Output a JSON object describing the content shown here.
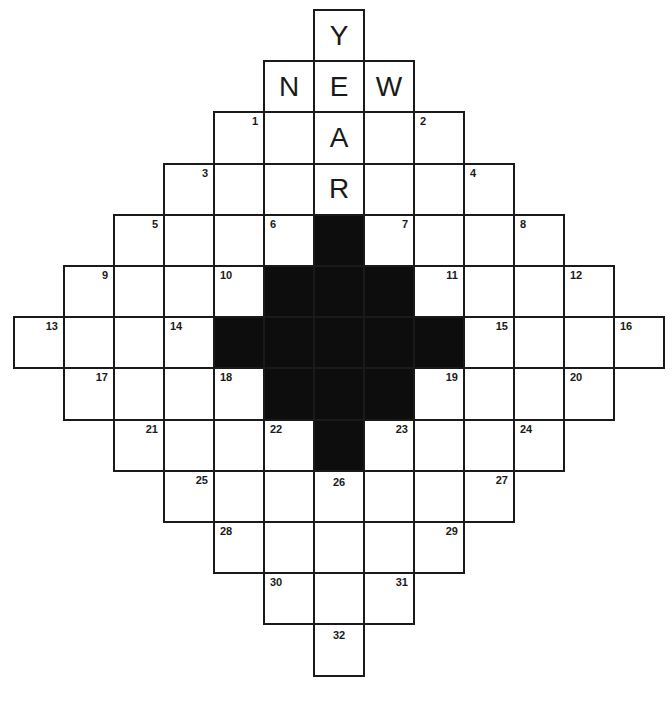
{
  "puzzle": {
    "title": "NEW YEAR crossword",
    "grid": {
      "cols": 13,
      "rows": 13,
      "origin_x": 14,
      "origin_y": 10,
      "cell_w": 50,
      "cell_h": 51.2,
      "colors": {
        "line": "#1a1a1a",
        "black": "#0d0d0d",
        "white": "#ffffff"
      }
    },
    "rows": [
      {
        "cells": [
          {
            "c": 6,
            "letter": "Y"
          }
        ]
      },
      {
        "cells": [
          {
            "c": 5,
            "letter": "N"
          },
          {
            "c": 6,
            "letter": "E"
          },
          {
            "c": 7,
            "letter": "W"
          }
        ]
      },
      {
        "cells": [
          {
            "c": 4,
            "num": "1",
            "pos": "tr"
          },
          {
            "c": 5
          },
          {
            "c": 6,
            "letter": "A"
          },
          {
            "c": 7
          },
          {
            "c": 8,
            "num": "2",
            "pos": "tl"
          }
        ]
      },
      {
        "cells": [
          {
            "c": 3,
            "num": "3",
            "pos": "tr"
          },
          {
            "c": 4
          },
          {
            "c": 5
          },
          {
            "c": 6,
            "letter": "R"
          },
          {
            "c": 7
          },
          {
            "c": 8
          },
          {
            "c": 9,
            "num": "4",
            "pos": "tl"
          }
        ]
      },
      {
        "cells": [
          {
            "c": 2,
            "num": "5",
            "pos": "tr"
          },
          {
            "c": 3
          },
          {
            "c": 4
          },
          {
            "c": 5,
            "num": "6",
            "pos": "tl"
          },
          {
            "c": 6,
            "black": true
          },
          {
            "c": 7,
            "num": "7",
            "pos": "tr"
          },
          {
            "c": 8
          },
          {
            "c": 9
          },
          {
            "c": 10,
            "num": "8",
            "pos": "tl"
          }
        ]
      },
      {
        "cells": [
          {
            "c": 1,
            "num": "9",
            "pos": "tr"
          },
          {
            "c": 2
          },
          {
            "c": 3
          },
          {
            "c": 4,
            "num": "10",
            "pos": "tl"
          },
          {
            "c": 5,
            "black": true
          },
          {
            "c": 6,
            "black": true
          },
          {
            "c": 7,
            "black": true
          },
          {
            "c": 8,
            "num": "11",
            "pos": "tr"
          },
          {
            "c": 9
          },
          {
            "c": 10
          },
          {
            "c": 11,
            "num": "12",
            "pos": "tl"
          }
        ]
      },
      {
        "cells": [
          {
            "c": 0,
            "num": "13",
            "pos": "tr"
          },
          {
            "c": 1
          },
          {
            "c": 2
          },
          {
            "c": 3,
            "num": "14",
            "pos": "tl"
          },
          {
            "c": 4,
            "black": true
          },
          {
            "c": 5,
            "black": true
          },
          {
            "c": 6,
            "black": true
          },
          {
            "c": 7,
            "black": true
          },
          {
            "c": 8,
            "black": true
          },
          {
            "c": 9,
            "num": "15",
            "pos": "tr"
          },
          {
            "c": 10
          },
          {
            "c": 11
          },
          {
            "c": 12,
            "num": "16",
            "pos": "tl"
          }
        ]
      },
      {
        "cells": [
          {
            "c": 1,
            "num": "17",
            "pos": "tr"
          },
          {
            "c": 2
          },
          {
            "c": 3
          },
          {
            "c": 4,
            "num": "18",
            "pos": "tl"
          },
          {
            "c": 5,
            "black": true
          },
          {
            "c": 6,
            "black": true
          },
          {
            "c": 7,
            "black": true
          },
          {
            "c": 8,
            "num": "19",
            "pos": "tr"
          },
          {
            "c": 9
          },
          {
            "c": 10
          },
          {
            "c": 11,
            "num": "20",
            "pos": "tl"
          }
        ]
      },
      {
        "cells": [
          {
            "c": 2,
            "num": "21",
            "pos": "tr"
          },
          {
            "c": 3
          },
          {
            "c": 4
          },
          {
            "c": 5,
            "num": "22",
            "pos": "tl"
          },
          {
            "c": 6,
            "black": true
          },
          {
            "c": 7,
            "num": "23",
            "pos": "tr"
          },
          {
            "c": 8
          },
          {
            "c": 9
          },
          {
            "c": 10,
            "num": "24",
            "pos": "tl"
          }
        ]
      },
      {
        "cells": [
          {
            "c": 3,
            "num": "25",
            "pos": "tr"
          },
          {
            "c": 4
          },
          {
            "c": 5
          },
          {
            "c": 6,
            "num": "26",
            "pos": "tc"
          },
          {
            "c": 7
          },
          {
            "c": 8
          },
          {
            "c": 9,
            "num": "27",
            "pos": "tr"
          }
        ]
      },
      {
        "cells": [
          {
            "c": 4,
            "num": "28",
            "pos": "tl"
          },
          {
            "c": 5
          },
          {
            "c": 6
          },
          {
            "c": 7
          },
          {
            "c": 8,
            "num": "29",
            "pos": "tr"
          }
        ]
      },
      {
        "cells": [
          {
            "c": 5,
            "num": "30",
            "pos": "tl"
          },
          {
            "c": 6
          },
          {
            "c": 7,
            "num": "31",
            "pos": "tr"
          }
        ]
      },
      {
        "cells": [
          {
            "c": 6,
            "num": "32",
            "pos": "tc"
          }
        ]
      }
    ]
  }
}
